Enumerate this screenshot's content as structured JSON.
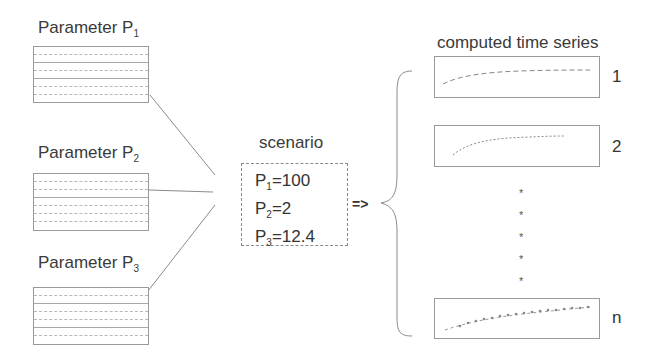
{
  "parameters": [
    {
      "label": "Parameter P",
      "sub": "1",
      "rows": 7
    },
    {
      "label": "Parameter P",
      "sub": "2",
      "rows": 7
    },
    {
      "label": "Parameter P",
      "sub": "3",
      "rows": 7
    }
  ],
  "scenario": {
    "title": "scenario",
    "lines": [
      {
        "name": "P",
        "sub": "1",
        "value": "=100"
      },
      {
        "name": "P",
        "sub": "2",
        "value": "=2"
      },
      {
        "name": "P",
        "sub": "3",
        "value": "=12.4"
      }
    ]
  },
  "arrow_label": "=>",
  "output": {
    "title": "computed time series",
    "series": [
      {
        "label": "1",
        "style": "dashed"
      },
      {
        "label": "2",
        "style": "dotted"
      },
      {
        "label": "n",
        "style": "dash-dot-markers"
      }
    ],
    "ellipsis": [
      "*",
      "*",
      "*",
      "*",
      "*"
    ]
  },
  "colors": {
    "line": "#9a9a9a",
    "text": "#333333",
    "background": "#ffffff"
  }
}
